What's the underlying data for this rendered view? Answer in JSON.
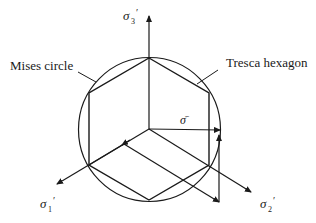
{
  "labels": {
    "mises": "Mises circle",
    "tresca": "Tresca hexagon",
    "sigma_bar": "σ̄",
    "axis1_main": "σ",
    "axis1_sub": "1",
    "axis2_main": "σ",
    "axis2_sub": "2",
    "axis3_main": "σ",
    "axis3_sub": "3",
    "prime": "′"
  },
  "colors": {
    "ink": "#1a1a1a",
    "background": "#ffffff"
  }
}
